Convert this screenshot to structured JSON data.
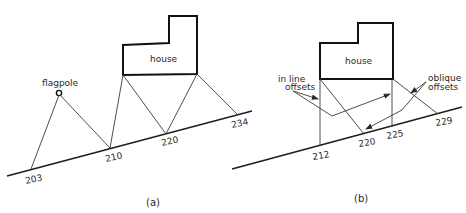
{
  "diagram_a": {
    "caption": "(a)",
    "house_label": "house",
    "flagpole_label": "flagpole",
    "chainages": [
      "203",
      "210",
      "220",
      "234"
    ]
  },
  "diagram_b": {
    "caption": "(b)",
    "house_label": "house",
    "inline_label_line1": "in line",
    "inline_label_line2": "offsets",
    "oblique_label_line1": "oblique",
    "oblique_label_line2": "offsets",
    "chainages": [
      "212",
      "220",
      "225",
      "229"
    ]
  },
  "colors": {
    "line": "#1e1e1e",
    "background": "#ffffff"
  }
}
